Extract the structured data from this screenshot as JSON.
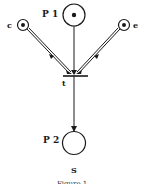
{
  "diagram": {
    "type": "petri-net",
    "places": [
      {
        "id": "P1",
        "label": "P 1",
        "tokens": 1
      },
      {
        "id": "c",
        "label": "c",
        "tokens": 1
      },
      {
        "id": "e",
        "label": "e",
        "tokens": 1
      },
      {
        "id": "P2",
        "label": "P 2",
        "tokens": 0,
        "sublabel": "S"
      }
    ],
    "transitions": [
      {
        "id": "t",
        "label": "t"
      }
    ],
    "arcs": [
      {
        "from": "c",
        "to": "t"
      },
      {
        "from": "P1",
        "to": "t"
      },
      {
        "from": "e",
        "to": "t"
      },
      {
        "from": "t",
        "to": "P2"
      }
    ],
    "caption": "Figure 1"
  },
  "colors": {
    "stroke": "#1a1a1a",
    "background": "#ffffff"
  }
}
